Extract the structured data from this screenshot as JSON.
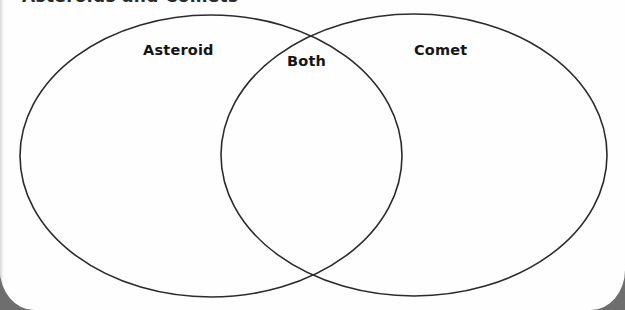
{
  "worksheet": {
    "heading": "Asteroids and Comets",
    "heading_visible": "clipped (only bottom edge of letters visible)"
  },
  "venn": {
    "circles": [
      {
        "id": "left",
        "label": "Asteroid",
        "cx": 211,
        "cy": 156,
        "rx": 191,
        "ry": 141
      },
      {
        "id": "right",
        "label": "Comet",
        "cx": 414,
        "cy": 155,
        "rx": 193,
        "ry": 141
      }
    ],
    "intersection_label": "Both",
    "stroke_color": "#2b2b2b",
    "regions": {
      "left_only": [],
      "overlap": [],
      "right_only": []
    }
  },
  "labels": {
    "left": "Asteroid",
    "overlap": "Both",
    "right": "Comet"
  },
  "colors": {
    "paper": "#fefefe",
    "background": "#6e6e6e",
    "ink": "#151515"
  }
}
